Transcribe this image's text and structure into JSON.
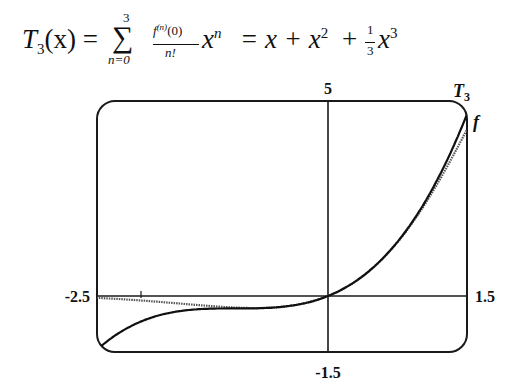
{
  "formula": {
    "lhs": "T",
    "lhs_sub": "3",
    "lhs_arg": "(x) =",
    "sum_symbol": "∑",
    "sum_upper": "3",
    "sum_lower": "n=0",
    "frac_num": "f",
    "frac_num_sup": "(n)",
    "frac_num_arg": "(0)",
    "frac_den": "n!",
    "term": "x",
    "term_sup": "n",
    "rhs1": "= x + x",
    "rhs1_sup": "2",
    "rhs2": "+",
    "frac2_num": "1",
    "frac2_den": "3",
    "rhs3": "x",
    "rhs3_sup": "3"
  },
  "chart_data": {
    "type": "line",
    "xlabel": "",
    "ylabel": "",
    "xlim": [
      -2.5,
      1.5
    ],
    "ylim": [
      -1.5,
      5
    ],
    "grid": false,
    "frame": true,
    "axis_tick_labels": {
      "x_min": "-2.5",
      "x_max": "1.5",
      "y_min": "-1.5",
      "y_max": "5"
    },
    "series": [
      {
        "name": "T3",
        "label": "T",
        "label_sub": "3",
        "expression": "x + x^2 + x^3/3",
        "x": [
          -2.5,
          -2.0,
          -1.5,
          -1.0,
          -0.5,
          0.0,
          0.5,
          1.0,
          1.5
        ],
        "values": [
          -1.458,
          -0.667,
          -0.375,
          -0.333,
          -0.292,
          0.0,
          0.792,
          2.333,
          4.875
        ]
      },
      {
        "name": "f",
        "label": "f",
        "expression": "e^x sin x",
        "x": [
          -2.5,
          -2.0,
          -1.5,
          -1.0,
          -0.5,
          0.0,
          0.5,
          1.0,
          1.5
        ],
        "values": [
          -0.049,
          -0.123,
          -0.223,
          -0.31,
          -0.291,
          0.0,
          0.79,
          2.287,
          4.47
        ]
      }
    ],
    "legend": "inline labels at right edge"
  }
}
